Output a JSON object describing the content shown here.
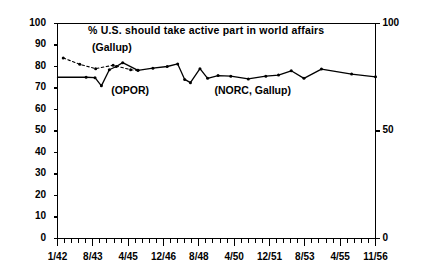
{
  "chart_data": {
    "type": "line",
    "title": "% U.S. should take active part in world affairs",
    "xlabel": "",
    "ylabel": "",
    "ylim": [
      0,
      100
    ],
    "y_ticks_left": [
      0,
      10,
      20,
      30,
      40,
      50,
      60,
      70,
      80,
      90,
      100
    ],
    "y_ticks_right": [
      0,
      50,
      100
    ],
    "grid": false,
    "legend_position": "inline-annotations",
    "x_tick_labels": [
      "1/42",
      "8/43",
      "4/45",
      "12/46",
      "8/48",
      "4/50",
      "12/51",
      "8/53",
      "4/55",
      "11/56"
    ],
    "annotations": [
      {
        "text": "(Gallup)",
        "x_frac": 0.115,
        "y_value": 88
      },
      {
        "text": "(OPOR)",
        "x_frac": 0.175,
        "y_value": 68
      },
      {
        "text": "(NORC, Gallup)",
        "x_frac": 0.5,
        "y_value": 68
      }
    ],
    "series": [
      {
        "name": "Gallup",
        "style": "dashed",
        "points": [
          {
            "x_frac": 0.018,
            "y": 84.0
          },
          {
            "x_frac": 0.07,
            "y": 81.0
          },
          {
            "x_frac": 0.12,
            "y": 79.0
          },
          {
            "x_frac": 0.175,
            "y": 80.6
          },
          {
            "x_frac": 0.23,
            "y": 78.5
          },
          {
            "x_frac": 0.253,
            "y": 78.2
          }
        ]
      },
      {
        "name": "OPOR, NORC, Gallup",
        "style": "solid",
        "points": [
          {
            "x_frac": 0.0,
            "y": 75.0
          },
          {
            "x_frac": 0.09,
            "y": 75.0
          },
          {
            "x_frac": 0.118,
            "y": 74.8
          },
          {
            "x_frac": 0.138,
            "y": 71.0
          },
          {
            "x_frac": 0.163,
            "y": 78.5
          },
          {
            "x_frac": 0.185,
            "y": 80.0
          },
          {
            "x_frac": 0.205,
            "y": 81.8
          },
          {
            "x_frac": 0.253,
            "y": 78.2
          },
          {
            "x_frac": 0.3,
            "y": 79.2
          },
          {
            "x_frac": 0.345,
            "y": 80.0
          },
          {
            "x_frac": 0.378,
            "y": 81.2
          },
          {
            "x_frac": 0.4,
            "y": 74.0
          },
          {
            "x_frac": 0.418,
            "y": 72.5
          },
          {
            "x_frac": 0.448,
            "y": 79.0
          },
          {
            "x_frac": 0.472,
            "y": 74.5
          },
          {
            "x_frac": 0.505,
            "y": 75.8
          },
          {
            "x_frac": 0.545,
            "y": 75.5
          },
          {
            "x_frac": 0.6,
            "y": 74.2
          },
          {
            "x_frac": 0.655,
            "y": 75.5
          },
          {
            "x_frac": 0.695,
            "y": 76.0
          },
          {
            "x_frac": 0.735,
            "y": 78.0
          },
          {
            "x_frac": 0.775,
            "y": 74.5
          },
          {
            "x_frac": 0.83,
            "y": 78.8
          },
          {
            "x_frac": 0.925,
            "y": 76.5
          },
          {
            "x_frac": 1.0,
            "y": 75.2
          }
        ]
      }
    ]
  }
}
